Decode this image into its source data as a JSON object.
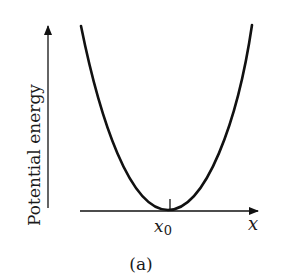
{
  "diagram": {
    "ylabel": "Potential energy",
    "xlabel": "x",
    "min_label_base": "x",
    "min_label_sub": "0",
    "caption": "(a)",
    "colors": {
      "stroke": "#111111",
      "background": "#ffffff"
    }
  }
}
